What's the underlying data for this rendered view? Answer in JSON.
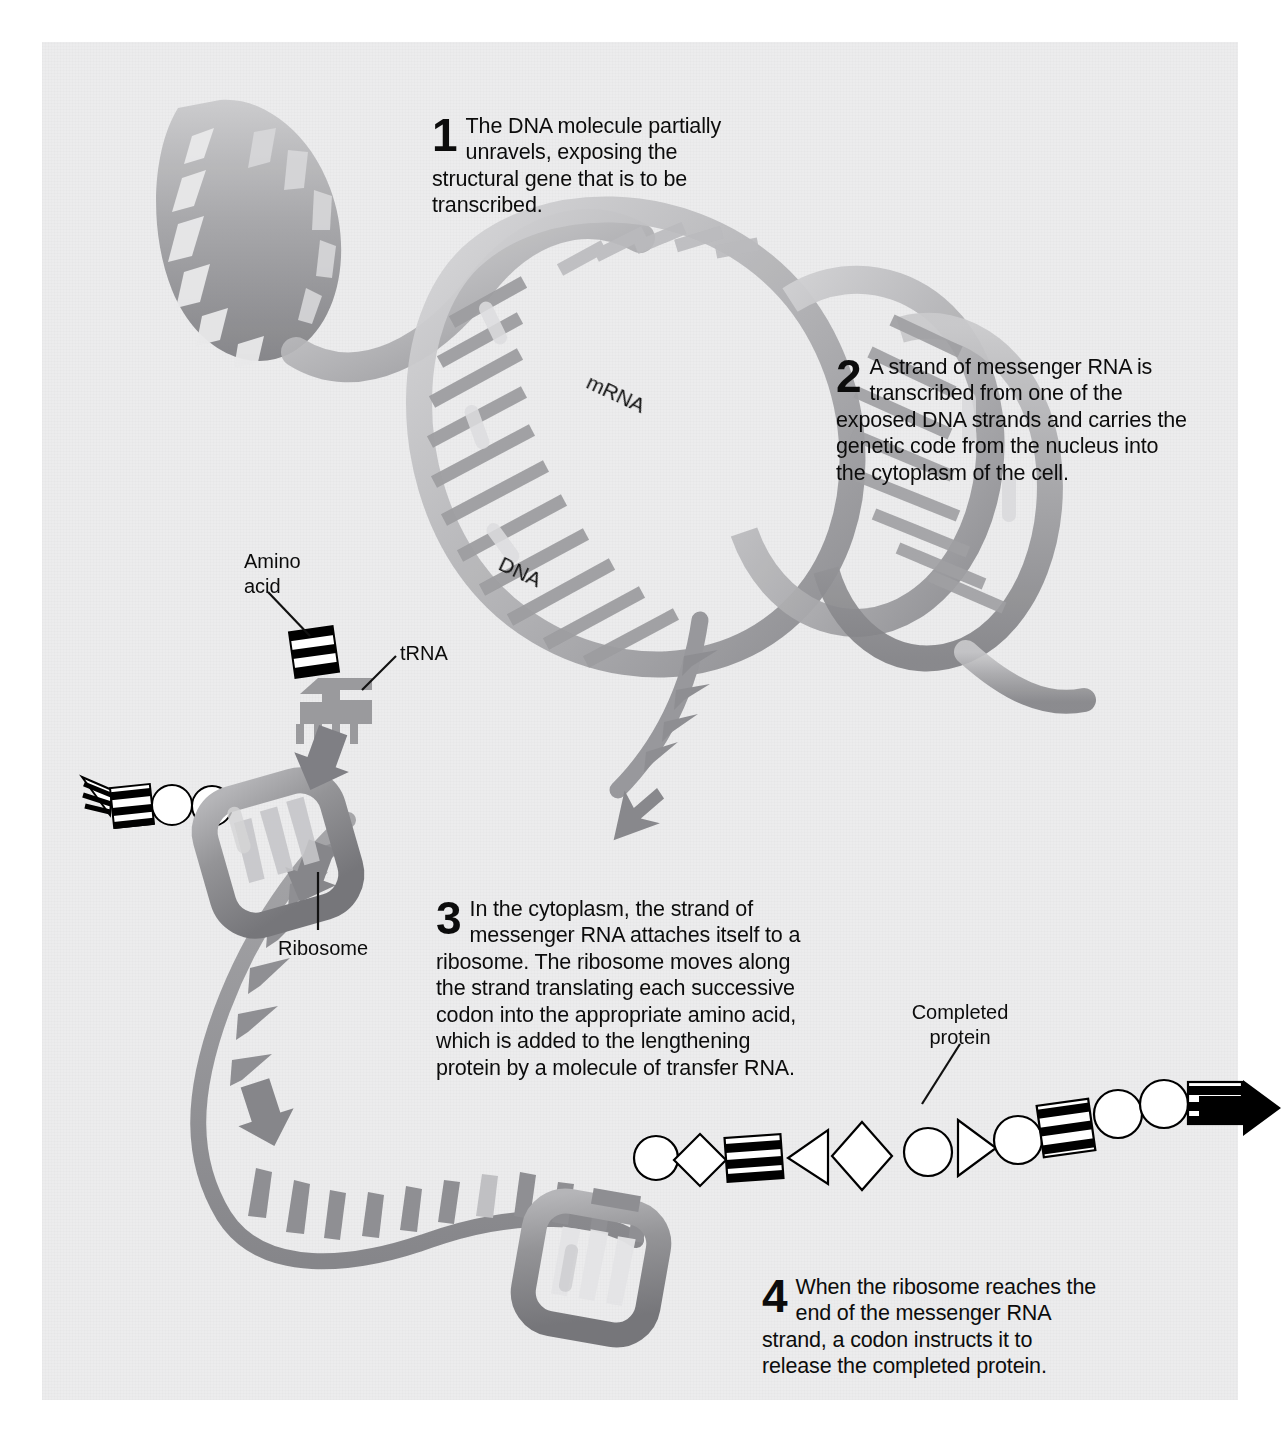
{
  "figure": {
    "background_color": "#ececed",
    "ink_color": "#0c0c0c",
    "steps": [
      {
        "number": "1",
        "text": "The DNA molecule partially unravels, exposing the structural gene that is to be transcribed."
      },
      {
        "number": "2",
        "text": "A strand of messenger RNA is transcribed from one of the exposed DNA strands and carries the genetic code from the nucleus into the cytoplasm of the cell."
      },
      {
        "number": "3",
        "text": "In the cytoplasm, the strand of messenger RNA attaches itself to a ribosome. The ribosome moves along the strand translating each successive codon into the appropriate amino acid, which is added to the lengthening protein by a molecule of transfer RNA."
      },
      {
        "number": "4",
        "text": "When the ribosome reaches the end of the messenger RNA strand, a codon instructs it to release the completed protein."
      }
    ],
    "labels": {
      "amino_acid": "Amino\nacid",
      "trna": "tRNA",
      "ribosome": "Ribosome",
      "completed_protein": "Completed\nprotein",
      "mrna": "mRNA",
      "dna": "DNA"
    },
    "palette": {
      "helix_dark": "#8e8e90",
      "helix_mid": "#a9a9ab",
      "helix_light": "#cfcfd1",
      "ribbon": "#9a9a9c",
      "ribosome": "#8f8f92",
      "arrow": "#86868a",
      "protein_stripe": "#000000"
    }
  }
}
